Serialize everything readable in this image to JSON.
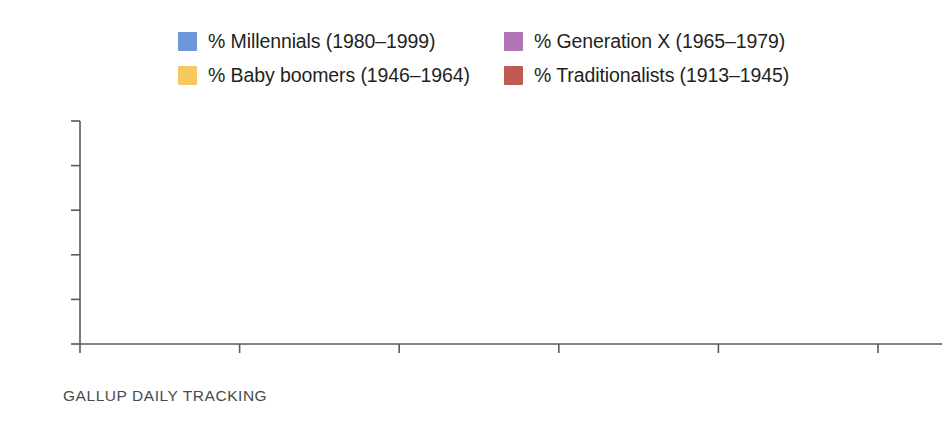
{
  "footnote": "GALLUP DAILY TRACKING",
  "legend": {
    "items": [
      {
        "label": "% Millennials (1980–1999)",
        "color": "#6d97d8",
        "swatch_name": "legend-swatch-millennials"
      },
      {
        "label": "% Generation X (1965–1979)",
        "color": "#b073b5",
        "swatch_name": "legend-swatch-generation-x"
      },
      {
        "label": "% Baby boomers (1946–1964)",
        "color": "#f5c95f",
        "swatch_name": "legend-swatch-baby-boomers"
      },
      {
        "label": "% Traditionalists (1913–1945)",
        "color": "#c05a52",
        "swatch_name": "legend-swatch-traditionalists"
      }
    ]
  },
  "axis": {
    "y_ticks": [
      "0",
      "2",
      "4",
      "6",
      "8",
      "10"
    ],
    "x_ticks": [
      "2012",
      "2013",
      "2014",
      "2015",
      "2016",
      "2017"
    ]
  },
  "chart_data": {
    "type": "line",
    "title": "",
    "subtitle": "",
    "xlabel": "",
    "ylabel": "",
    "source": "GALLUP DAILY TRACKING",
    "categories": [
      "2012",
      "2013",
      "2014",
      "2015",
      "2016",
      "2017"
    ],
    "x": [
      2012,
      2013,
      2014,
      2015,
      2016,
      2017
    ],
    "ylim": [
      0,
      10
    ],
    "xlim": [
      2012,
      2017
    ],
    "y_ticks": [
      0,
      2,
      4,
      6,
      8,
      10
    ],
    "grid": false,
    "legend_position": "top",
    "series": [
      {
        "name": "% Millennials (1980–1999)",
        "color": "#6d97d8",
        "values": [
          5.8,
          6.0,
          6.3,
          6.7,
          7.3,
          8.2
        ],
        "labels": [
          "5.8",
          "6.0",
          "6.3",
          "6.7",
          "7.3",
          "8.2"
        ]
      },
      {
        "name": "% Generation X (1965–1979)",
        "color": "#b073b5",
        "values": [
          3.2,
          3.3,
          3.4,
          3.3,
          3.2,
          3.5
        ],
        "labels": [
          "3.2",
          "3.3",
          "3.4",
          "3.3",
          "3.2",
          "3.5"
        ]
      },
      {
        "name": "% Baby boomers (1946–1964)",
        "color": "#f5c95f",
        "values": [
          2.7,
          2.7,
          2.7,
          2.6,
          2.4,
          2.4
        ],
        "labels": [
          "2.7",
          "2.7",
          "2.7",
          "2.6",
          "2.4",
          "2.4"
        ]
      },
      {
        "name": "% Traditionalists (1913–1945)",
        "color": "#c05a52",
        "values": [
          1.8,
          1.8,
          1.9,
          1.5,
          1.4,
          1.4
        ],
        "labels": [
          "1.8",
          "1.8",
          "1.9",
          "1.5",
          "1.4",
          "1.4"
        ]
      }
    ]
  },
  "label_layout": {
    "millennials": [
      {
        "i": 0,
        "dx": 0,
        "dy": -26
      },
      {
        "i": 1,
        "dx": 0,
        "dy": -26
      },
      {
        "i": 2,
        "dx": 0,
        "dy": -28
      },
      {
        "i": 3,
        "dx": 0,
        "dy": -30
      },
      {
        "i": 4,
        "dx": 0,
        "dy": -30
      },
      {
        "i": 5,
        "dx": -12,
        "dy": -30
      }
    ],
    "generation_x": [
      {
        "i": 0,
        "dx": 0,
        "dy": -24
      },
      {
        "i": 1,
        "dx": 0,
        "dy": -24
      },
      {
        "i": 2,
        "dx": 0,
        "dy": -24
      },
      {
        "i": 3,
        "dx": 0,
        "dy": -24
      },
      {
        "i": 4,
        "dx": 0,
        "dy": -24
      },
      {
        "i": 5,
        "dx": -12,
        "dy": -26
      }
    ],
    "baby_boomers": [
      {
        "i": 0,
        "dx": -24,
        "dy": 0
      },
      {
        "i": 1,
        "dx": 0,
        "dy": 20
      },
      {
        "i": 2,
        "dx": 0,
        "dy": 20
      },
      {
        "i": 3,
        "dx": 0,
        "dy": 22
      },
      {
        "i": 4,
        "dx": 0,
        "dy": 22
      },
      {
        "i": 5,
        "dx": 22,
        "dy": 2
      }
    ],
    "traditionalists": [
      {
        "i": 0,
        "dx": 0,
        "dy": 26
      },
      {
        "i": 1,
        "dx": 0,
        "dy": 26
      },
      {
        "i": 2,
        "dx": 0,
        "dy": 26
      },
      {
        "i": 3,
        "dx": 0,
        "dy": 24
      },
      {
        "i": 4,
        "dx": 0,
        "dy": 24
      },
      {
        "i": 5,
        "dx": -12,
        "dy": 26
      }
    ]
  }
}
